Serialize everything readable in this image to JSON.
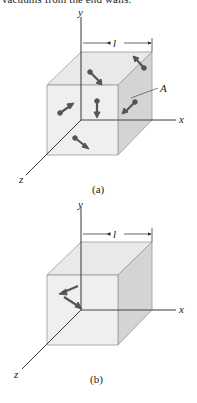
{
  "header": {
    "cropped_text": "vacuums from the end walls."
  },
  "figures": [
    {
      "id": "a",
      "caption": "(a)",
      "axes": {
        "x": "x",
        "y": "y",
        "z": "z"
      },
      "dimension_label": "l",
      "face_label": "A",
      "molecule_arrows": 6
    },
    {
      "id": "b",
      "caption": "(b)",
      "axes": {
        "x": "x",
        "y": "y",
        "z": "z"
      },
      "dimension_label": "l",
      "molecule_arrows": 2
    }
  ],
  "colors": {
    "cube_front": "#eeeeee",
    "cube_top": "#e6e6e6",
    "cube_side": "#d2d2d2",
    "edge": "#9a9a9a",
    "axis": "#222222",
    "arrow": "#555555"
  }
}
